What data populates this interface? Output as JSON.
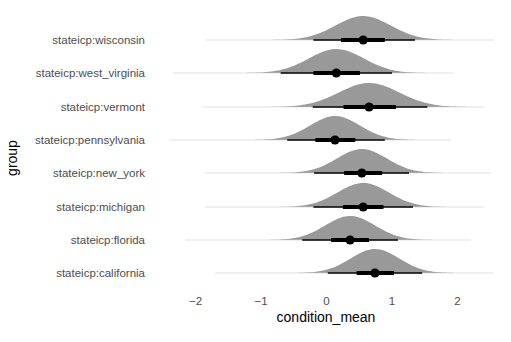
{
  "chart_data": {
    "type": "halfeye",
    "title": "",
    "xlabel": "condition_mean",
    "ylabel": "group",
    "xlim": [
      -2.5,
      2.6
    ],
    "x_ticks": [
      -2,
      -1,
      0,
      1,
      2
    ],
    "x_tick_labels": [
      "−2",
      "−1",
      "0",
      "1",
      "2"
    ],
    "grid": false,
    "legend": "none",
    "fill_color": "#999999",
    "interval_color": "#000000",
    "categories": [
      "stateicp:wisconsin",
      "stateicp:west_virginia",
      "stateicp:vermont",
      "stateicp:pennsylvania",
      "stateicp:new_york",
      "stateicp:michigan",
      "stateicp:florida",
      "stateicp:california"
    ],
    "series": [
      {
        "group": "stateicp:wisconsin",
        "point": 0.56,
        "inner": [
          0.22,
          0.89
        ],
        "outer": [
          -0.2,
          1.35
        ],
        "sd": 0.42,
        "tail": [
          -1.85,
          2.55
        ]
      },
      {
        "group": "stateicp:west_virginia",
        "point": 0.15,
        "inner": [
          -0.2,
          0.51
        ],
        "outer": [
          -0.7,
          1.0
        ],
        "sd": 0.42,
        "tail": [
          -2.35,
          1.95
        ]
      },
      {
        "group": "stateicp:vermont",
        "point": 0.65,
        "inner": [
          0.26,
          1.06
        ],
        "outer": [
          -0.21,
          1.54
        ],
        "sd": 0.46,
        "tail": [
          -1.9,
          2.4
        ]
      },
      {
        "group": "stateicp:pennsylvania",
        "point": 0.13,
        "inner": [
          -0.17,
          0.44
        ],
        "outer": [
          -0.6,
          0.89
        ],
        "sd": 0.38,
        "tail": [
          -2.4,
          1.9
        ]
      },
      {
        "group": "stateicp:new_york",
        "point": 0.54,
        "inner": [
          0.27,
          0.85
        ],
        "outer": [
          -0.19,
          1.26
        ],
        "sd": 0.38,
        "tail": [
          -1.85,
          2.5
        ]
      },
      {
        "group": "stateicp:michigan",
        "point": 0.56,
        "inner": [
          0.25,
          0.87
        ],
        "outer": [
          -0.2,
          1.32
        ],
        "sd": 0.39,
        "tail": [
          -1.85,
          2.4
        ]
      },
      {
        "group": "stateicp:florida",
        "point": 0.36,
        "inner": [
          0.07,
          0.65
        ],
        "outer": [
          -0.37,
          1.09
        ],
        "sd": 0.38,
        "tail": [
          -2.15,
          2.2
        ]
      },
      {
        "group": "stateicp:california",
        "point": 0.74,
        "inner": [
          0.46,
          1.03
        ],
        "outer": [
          0.02,
          1.46
        ],
        "sd": 0.37,
        "tail": [
          -1.7,
          2.55
        ]
      }
    ]
  }
}
